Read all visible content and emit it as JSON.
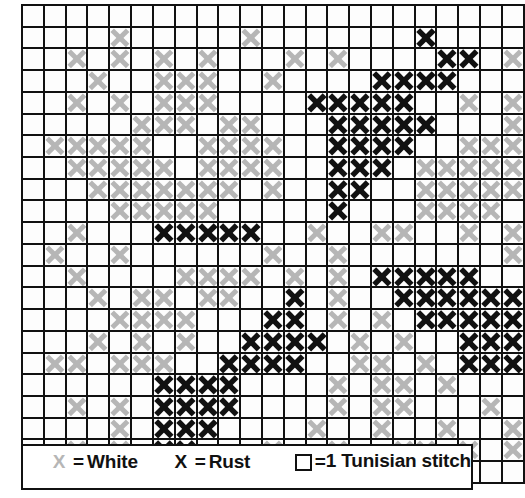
{
  "chart_data": {
    "type": "heatmap",
    "grid_cols": 23,
    "grid_rows": 22,
    "symbol_meanings": {
      ".": "empty (no stitch)",
      "w": "White",
      "r": "Rust"
    },
    "colors": {
      "white_symbol": "#b6b6b6",
      "rust_symbol": "#111111",
      "grid_line": "#111111",
      "cell_background": "#fdfdfd",
      "page_background": "#ffffff"
    },
    "grid": [
      ".......................",
      "....w.....w.......r....",
      "..w.w.w.w...w.w....rr.w.w",
      "...w..www..w....rrrr...w.",
      "..w.w.www....rrrrr..w.w..",
      ".....www.ww...rrrrr...w.w",
      ".wwwww..wwww..rrrr..wwww.",
      "..wwwww.wwww..rrr.wwwwww.",
      "...wwwwwww.w..rr..wwwww..",
      "....wwwww.....r...wwww...",
      "..w...rrrrr..w..ww..w.w..",
      ".w..w......w..w.......w.w",
      "..w....wwww.w.w.rrrrr..w.",
      "...w.ww.ww..r.w..rrrrrr..",
      "....wwww...rr.w.w.rrrrr..",
      "...w.w.w..rrrr.w.w..rrrrr",
      ".ww.www..rrrr..ww.w.rrrrr",
      "......rrrr....w.ww.w.....",
      "..w.w.rrrr....w.ww...w.w.",
      "....w.rrr....w..w..w..w..",
      "..w.w.rr...w..w..ww.w.w..",
      "......r.....w....w......."
    ]
  },
  "legend": {
    "items": [
      {
        "symbol": "X",
        "symbol_kind": "white-x-symbol",
        "eq": "=",
        "label": "White"
      },
      {
        "symbol": "X",
        "symbol_kind": "rust-x-symbol",
        "eq": "=",
        "label": "Rust"
      },
      {
        "symbol": "□",
        "symbol_kind": "empty-square-symbol",
        "eq": "=",
        "label_line1": "1 Tunisian",
        "label_line2": "stitch"
      }
    ]
  }
}
